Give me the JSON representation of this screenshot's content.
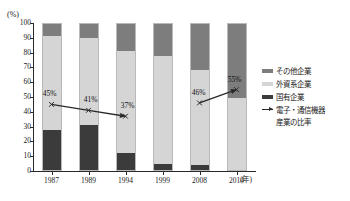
{
  "title_strip": "",
  "axis": {
    "y_unit": "(%)",
    "x_unit": "(年)",
    "y_ticks": [
      "100",
      "90",
      "80",
      "70",
      "60",
      "50",
      "40",
      "30",
      "20",
      "10",
      "0"
    ]
  },
  "legend": {
    "items": [
      {
        "key": "other",
        "label": "その他企業",
        "swatch": "legend-swatch-other",
        "color": "#7d7d7d"
      },
      {
        "key": "foreign",
        "label": "外資系企業",
        "swatch": "legend-swatch-foreign",
        "color": "#d5d5d5"
      },
      {
        "key": "state",
        "label": "国有企業",
        "swatch": "legend-swatch-state",
        "color": "#3b3b3b"
      },
      {
        "key": "line",
        "label": "電子・通信機器",
        "label2": "産業の比率",
        "swatch": "legend-swatch-line",
        "color": "#2a2a2a"
      }
    ]
  },
  "chart_data": {
    "type": "bar",
    "stacked": true,
    "title": "",
    "xlabel": "年",
    "ylabel": "%",
    "ylim": [
      0,
      100
    ],
    "grid": false,
    "legend_position": "right",
    "categories": [
      "1987",
      "1989",
      "1994",
      "1999",
      "2008",
      "2014"
    ],
    "series": [
      {
        "name": "国有企業",
        "key": "state",
        "color": "#3b3b3b",
        "values": [
          28,
          31,
          12,
          5,
          4,
          0
        ]
      },
      {
        "name": "外資系企業",
        "key": "foreign",
        "color": "#d5d5d5",
        "values": [
          63,
          59,
          69,
          73,
          64,
          49
        ]
      },
      {
        "name": "その他企業",
        "key": "other",
        "color": "#7d7d7d",
        "values": [
          9,
          10,
          19,
          22,
          32,
          51
        ]
      }
    ],
    "overlay_line": {
      "name": "電子・通信機器産業の比率",
      "color": "#2a2a2a",
      "points": [
        {
          "x": "1987",
          "value": 45,
          "label": "45%",
          "label_dx": -2,
          "label_dy": -6
        },
        {
          "x": "1989",
          "value": 41,
          "label": "41%",
          "label_dx": 2,
          "label_dy": -6
        },
        {
          "x": "1994",
          "value": 37,
          "label": "37%",
          "label_dx": 2,
          "label_dy": -6
        },
        {
          "x": "2008",
          "value": 46,
          "label": "46%",
          "label_dx": -1,
          "label_dy": -6
        },
        {
          "x": "2014",
          "value": 55,
          "label": "55%",
          "label_dx": -2,
          "label_dy": -6
        }
      ],
      "segments": [
        [
          0,
          1
        ],
        [
          1,
          2
        ],
        [
          3,
          4
        ]
      ],
      "arrow_ends": [
        "1994",
        "2014"
      ]
    }
  }
}
